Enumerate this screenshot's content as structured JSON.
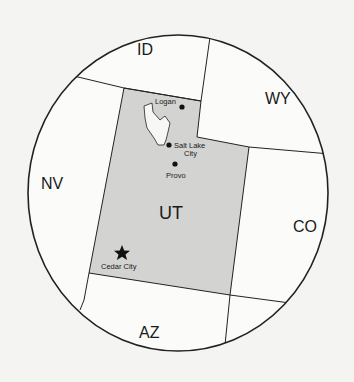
{
  "map": {
    "colors": {
      "background": "#f4f4f2",
      "land": "#fbfbfa",
      "highlight_state": "#d3d3d1",
      "lake": "#f7f7f5",
      "border": "#222222"
    },
    "states": [
      {
        "id": "ID",
        "label": "ID",
        "highlighted": false
      },
      {
        "id": "WY",
        "label": "WY",
        "highlighted": false
      },
      {
        "id": "NV",
        "label": "NV",
        "highlighted": false
      },
      {
        "id": "UT",
        "label": "UT",
        "highlighted": true
      },
      {
        "id": "CO",
        "label": "CO",
        "highlighted": false
      },
      {
        "id": "AZ",
        "label": "AZ",
        "highlighted": false
      }
    ],
    "cities": [
      {
        "name": "Logan",
        "marker": "dot"
      },
      {
        "name": "Salt Lake City",
        "line1": "Salt Lake",
        "line2": "City",
        "marker": "dot"
      },
      {
        "name": "Provo",
        "marker": "dot"
      },
      {
        "name": "Cedar City",
        "marker": "star"
      }
    ],
    "features": [
      {
        "name": "Great Salt Lake",
        "type": "lake",
        "labeled": false
      }
    ]
  }
}
